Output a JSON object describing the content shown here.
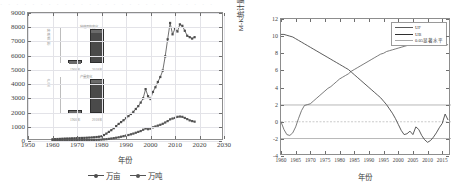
{
  "top_strip_text": "· · · · · · · · · · · · · · · · · · · · · · · · · · ·",
  "chart_data": [
    {
      "type": "line",
      "panel": "left",
      "title": "",
      "xlabel": "年份",
      "ylabel": "",
      "xlim": [
        1950,
        2030
      ],
      "ylim": [
        0,
        9000
      ],
      "xticks": [
        1950,
        1960,
        1970,
        1980,
        1990,
        2000,
        2010,
        2020,
        2030
      ],
      "yticks": [
        0,
        1000,
        2000,
        3000,
        4000,
        5000,
        6000,
        7000,
        8000,
        9000
      ],
      "grid": true,
      "legend_position": "below",
      "series": [
        {
          "name": "万亩",
          "color": "#4d4d4d",
          "marker": "square",
          "x": [
            1960,
            1961,
            1962,
            1963,
            1964,
            1965,
            1966,
            1967,
            1968,
            1969,
            1970,
            1971,
            1972,
            1973,
            1974,
            1975,
            1976,
            1977,
            1978,
            1979,
            1980,
            1981,
            1982,
            1983,
            1984,
            1985,
            1986,
            1987,
            1988,
            1989,
            1990,
            1991,
            1992,
            1993,
            1994,
            1995,
            1996,
            1997,
            1998,
            1999,
            2000,
            2001,
            2002,
            2003,
            2004,
            2005,
            2006,
            2007,
            2008,
            2009,
            2010,
            2011,
            2012,
            2013,
            2014,
            2015,
            2016,
            2017,
            2018
          ],
          "y": [
            120,
            130,
            140,
            150,
            160,
            170,
            175,
            180,
            185,
            190,
            200,
            210,
            215,
            220,
            230,
            240,
            250,
            260,
            280,
            300,
            330,
            420,
            520,
            640,
            760,
            900,
            1050,
            1200,
            1330,
            1460,
            1600,
            1750,
            1900,
            2050,
            2250,
            2450,
            2700,
            3000,
            3650,
            3150,
            2950,
            3450,
            3780,
            4150,
            4500,
            4950,
            5950,
            7150,
            8300,
            7500,
            7900,
            7700,
            8200,
            8100,
            7750,
            7400,
            7300,
            7200,
            7300
          ]
        },
        {
          "name": "万吨",
          "color": "#555555",
          "marker": "square",
          "x": [
            1960,
            1961,
            1962,
            1963,
            1964,
            1965,
            1966,
            1967,
            1968,
            1969,
            1970,
            1971,
            1972,
            1973,
            1974,
            1975,
            1976,
            1977,
            1978,
            1979,
            1980,
            1981,
            1982,
            1983,
            1984,
            1985,
            1986,
            1987,
            1988,
            1989,
            1990,
            1991,
            1992,
            1993,
            1994,
            1995,
            1996,
            1997,
            1998,
            1999,
            2000,
            2001,
            2002,
            2003,
            2004,
            2005,
            2006,
            2007,
            2008,
            2009,
            2010,
            2011,
            2012,
            2013,
            2014,
            2015,
            2016,
            2017,
            2018
          ],
          "y": [
            30,
            32,
            35,
            38,
            40,
            42,
            45,
            47,
            50,
            52,
            55,
            58,
            60,
            62,
            65,
            70,
            72,
            75,
            80,
            90,
            100,
            115,
            130,
            150,
            175,
            200,
            230,
            260,
            300,
            340,
            380,
            420,
            470,
            520,
            580,
            640,
            700,
            790,
            880,
            830,
            870,
            960,
            1020,
            1080,
            1140,
            1210,
            1300,
            1400,
            1520,
            1580,
            1620,
            1700,
            1720,
            1700,
            1620,
            1540,
            1450,
            1400,
            1360
          ]
        }
      ],
      "inset_charts": [
        {
          "ylabel": "种植面积",
          "title": "种植面积变化",
          "categories": [
            "1960年",
            "2018年"
          ],
          "values": [
            120,
            7300
          ]
        },
        {
          "ylabel": "产量",
          "title": "产量变化",
          "categories": [
            "1960年",
            "2018年"
          ],
          "values": [
            30,
            1360
          ]
        }
      ]
    },
    {
      "type": "line",
      "panel": "right",
      "title": "",
      "xlabel": "年份",
      "ylabel": "M-K统计量",
      "xlim": [
        1960,
        2018
      ],
      "ylim": [
        -4,
        12
      ],
      "xticks": [
        1960,
        1965,
        1970,
        1975,
        1980,
        1985,
        1990,
        1995,
        2000,
        2005,
        2010,
        2015
      ],
      "yticks": [
        -4,
        -2,
        0,
        2,
        4,
        6,
        8,
        10,
        12
      ],
      "grid": false,
      "legend_position": "top-right",
      "reference_lines": [
        {
          "value": 1.96,
          "label": "0.05显著水平",
          "color": "#9a9a9a"
        },
        {
          "value": -1.96,
          "label": "0.05显著水平",
          "color": "#9a9a9a"
        },
        {
          "value": 0,
          "label": "",
          "color": "#b5b5b5"
        }
      ],
      "series": [
        {
          "name": "UF",
          "color": "#5a5a5a",
          "x": [
            1960,
            1961,
            1962,
            1963,
            1964,
            1965,
            1966,
            1967,
            1968,
            1969,
            1970,
            1971,
            1972,
            1973,
            1974,
            1975,
            1976,
            1977,
            1978,
            1979,
            1980,
            1981,
            1982,
            1983,
            1984,
            1985,
            1986,
            1987,
            1988,
            1989,
            1990,
            1991,
            1992,
            1993,
            1994,
            1995,
            1996,
            1997,
            1998,
            1999,
            2000,
            2001,
            2002,
            2003,
            2004,
            2005,
            2006,
            2007,
            2008,
            2009,
            2010,
            2011,
            2012,
            2013,
            2014,
            2015,
            2016,
            2017
          ],
          "y": [
            0.0,
            -0.9,
            -1.5,
            -1.6,
            -1.3,
            -0.6,
            0.4,
            1.3,
            1.9,
            2.0,
            2.1,
            2.4,
            2.7,
            3.0,
            3.3,
            3.6,
            3.9,
            4.1,
            4.4,
            4.7,
            5.0,
            5.2,
            5.4,
            5.6,
            5.9,
            6.1,
            6.3,
            6.5,
            6.7,
            6.9,
            7.1,
            7.3,
            7.5,
            7.7,
            7.9,
            8.0,
            8.2,
            8.3,
            8.4,
            8.5,
            8.6,
            8.7,
            8.8,
            8.9,
            9.0,
            9.0,
            9.0,
            9.0,
            9.0,
            9.0,
            9.0,
            9.0,
            9.0,
            9.0,
            9.0,
            9.0,
            9.0,
            9.0
          ]
        },
        {
          "name": "UB",
          "color": "#4a4a4a",
          "x": [
            1960,
            1961,
            1962,
            1963,
            1964,
            1965,
            1966,
            1967,
            1968,
            1969,
            1970,
            1971,
            1972,
            1973,
            1974,
            1975,
            1976,
            1977,
            1978,
            1979,
            1980,
            1981,
            1982,
            1983,
            1984,
            1985,
            1986,
            1987,
            1988,
            1989,
            1990,
            1991,
            1992,
            1993,
            1994,
            1995,
            1996,
            1997,
            1998,
            1999,
            2000,
            2001,
            2002,
            2003,
            2004,
            2005,
            2006,
            2007,
            2008,
            2009,
            2010,
            2011,
            2012,
            2013,
            2014,
            2015,
            2016,
            2017
          ],
          "y": [
            10.2,
            10.2,
            10.1,
            10.0,
            9.9,
            9.7,
            9.5,
            9.3,
            9.1,
            8.9,
            8.7,
            8.5,
            8.3,
            8.1,
            7.9,
            7.7,
            7.5,
            7.3,
            7.1,
            6.9,
            6.7,
            6.5,
            6.3,
            6.1,
            5.8,
            5.5,
            5.2,
            4.9,
            4.6,
            4.3,
            4.0,
            3.7,
            3.4,
            3.1,
            2.8,
            2.4,
            2.0,
            1.5,
            1.0,
            0.4,
            -0.3,
            -1.0,
            -1.5,
            -1.4,
            -1.1,
            -1.5,
            -0.6,
            -0.9,
            -1.6,
            -2.1,
            -2.4,
            -2.2,
            -1.8,
            -1.3,
            -0.7,
            -0.2,
            0.9,
            0.2
          ]
        }
      ]
    }
  ]
}
